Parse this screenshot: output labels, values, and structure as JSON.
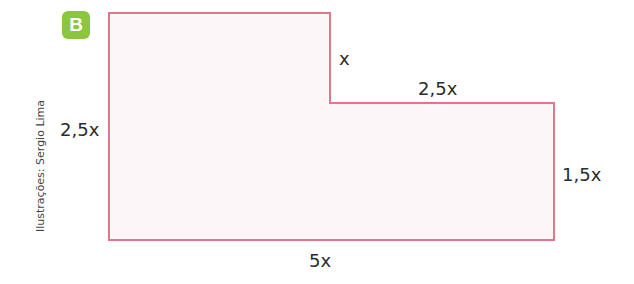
{
  "badge": {
    "label": "B",
    "color": "#8cc63f"
  },
  "credit": "Ilustrações: Sergio Lima",
  "shape": {
    "stroke": "#e5758f",
    "fill": "#fdf6f8",
    "points": "109,13 330,13 330,103 554,103 554,240 109,240"
  },
  "labels": {
    "left_height": "2,5x",
    "notch_height": "x",
    "top_right_width": "2,5x",
    "right_height": "1,5x",
    "bottom_width": "5x"
  }
}
